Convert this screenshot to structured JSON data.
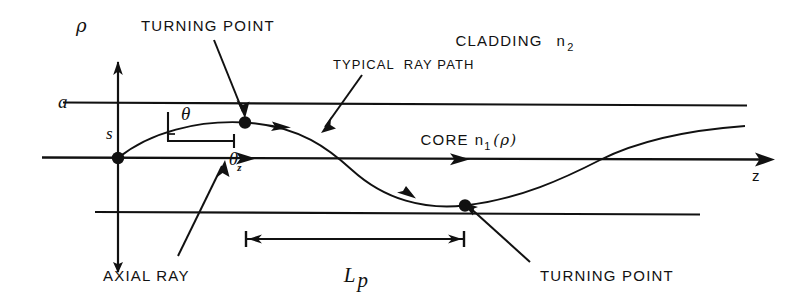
{
  "figure": {
    "title_type": "optical-fiber-ray-path-diagram",
    "background_color": "#ffffff",
    "ink_color": "#111111"
  },
  "axes": {
    "vertical_axis_label": "ρ",
    "horizontal_axis_label": "z",
    "core_radius_label": "a",
    "arc_length_label": "s"
  },
  "angles": {
    "theta": "θ",
    "theta_z_base": "θ",
    "theta_z_sub": "z"
  },
  "regions": {
    "cladding_label": "CLADDING",
    "cladding_index_base": "n",
    "cladding_index_sub": "2",
    "core_label": "CORE",
    "core_index_base": "n",
    "core_index_sub": "1",
    "core_index_arg": "(ρ)"
  },
  "annotations": {
    "turning_point_top": "TURNING POINT",
    "turning_point_bottom": "TURNING POINT",
    "typical_ray_path": "TYPICAL  RAY PATH",
    "axial_ray": "AXIAL RAY",
    "period_base": "L",
    "period_sub": "p"
  },
  "geometry": {
    "top_cladding_boundary_y": 103,
    "axis_y": 158,
    "bottom_cladding_boundary_y": 213,
    "origin_x": 118,
    "turning_point_top": {
      "x": 245,
      "y": 123
    },
    "turning_point_bottom": {
      "x": 465,
      "y": 205
    },
    "period_span": {
      "x1": 246,
      "x2": 464,
      "y": 239
    }
  }
}
